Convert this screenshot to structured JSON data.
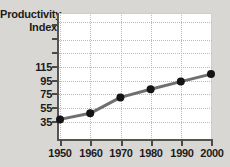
{
  "chart_data": {
    "type": "line",
    "title": "Productivity Index",
    "title_lines": [
      "Productivity",
      "Index"
    ],
    "xlabel": "",
    "ylabel": "Productivity Index",
    "categories": [
      "1950",
      "1960",
      "1970",
      "1980",
      "1990",
      "2000"
    ],
    "x": [
      1950,
      1960,
      1970,
      1980,
      1990,
      2000
    ],
    "values": [
      38,
      47,
      70,
      82,
      93,
      104
    ],
    "series": [
      {
        "name": "Productivity Index",
        "values": [
          38,
          47,
          70,
          82,
          93,
          104
        ],
        "line_color": "#6f6f6d",
        "marker_color": "#141414"
      }
    ],
    "xlim": [
      1950,
      2000
    ],
    "ylim": [
      15,
      135
    ],
    "ytick_labels": [
      "35",
      "55",
      "75",
      "95",
      "115"
    ],
    "ytick_values": [
      35,
      55,
      75,
      95,
      115
    ],
    "xtick_labels": [
      "1950",
      "1960",
      "1970",
      "1980",
      "1990",
      "2000"
    ],
    "grid": true,
    "grid_style": "dotted",
    "grid_color": "#bdbbb8",
    "legend": "none",
    "plot_background": "#ffffff",
    "figure_background": "#d9d7d4",
    "axis_color": "#4c4a47"
  }
}
